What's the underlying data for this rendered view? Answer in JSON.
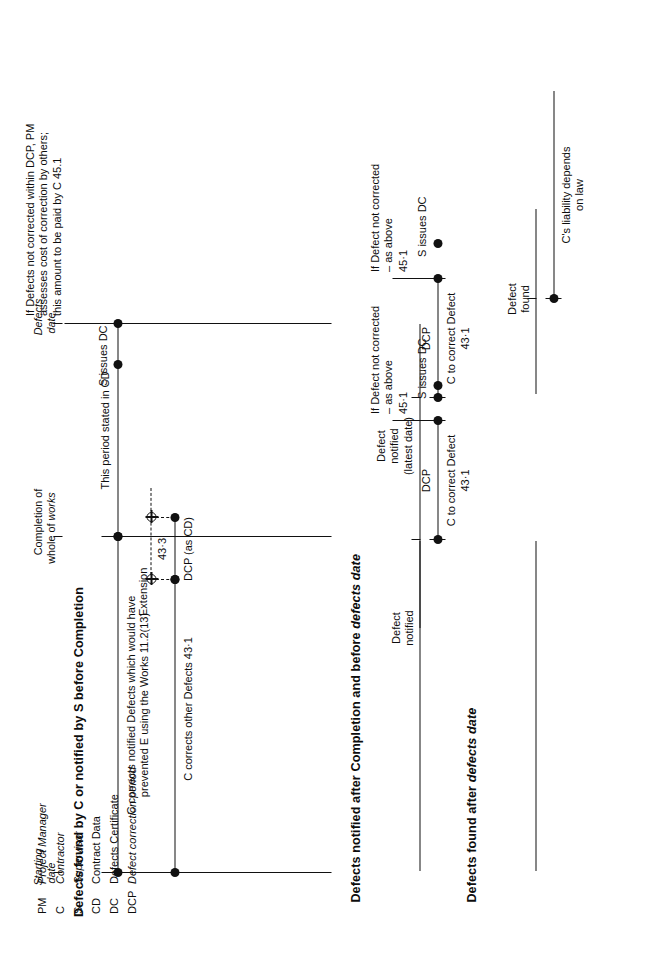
{
  "diagram": {
    "legend": {
      "rows": [
        {
          "key": "PM",
          "label": "Project Manager",
          "italic": true
        },
        {
          "key": "C",
          "label": "Contractor",
          "italic": true
        },
        {
          "key": "S",
          "label": "Supervisor",
          "italic": true
        },
        {
          "key": "CD",
          "label": "Contract Data",
          "italic": false
        },
        {
          "key": "DC",
          "label": "Defects Certificate",
          "italic": false
        },
        {
          "key": "DCP",
          "label": "Defect correction period",
          "italic": true
        }
      ]
    },
    "axis_captions": {
      "starting_date": "Starting\ndate",
      "completion": "Completion of\nwhole of works",
      "defects_date": "Defects\ndate"
    },
    "panels": [
      {
        "id": "panel-1",
        "title": "Defects found by C or notified by S before Completion",
        "labels": {
          "corrects_notified": "C corrects notified Defects which would have\nprevented E using the Works 11.2(13)",
          "corrects_other": "C corrects other Defects 43·1",
          "this_period": "This period stated in CD",
          "dcp_as_cd": "DCP (as CD)",
          "extension": "Extension",
          "extension_clause": "43·3",
          "s_issues_dc": "S issues DC",
          "pm_assesses": "If Defects not corrected within DCP, PM\nassesses cost of correction by others;\nthis amount to be paid by C 45.1"
        }
      },
      {
        "id": "panel-2",
        "title": "Defects notified after Completion and before defects date",
        "title_italic_tail": "defects date",
        "groups": [
          {
            "id": "group-early",
            "defect_notified": "Defect\nnotified",
            "dcp": "DCP",
            "c_to_correct": "C to correct Defect",
            "c_to_correct_clause": "43·1",
            "s_issues_dc": "S issues DC",
            "if_not_corrected": "If Defect not corrected\n– as above",
            "if_not_corrected_clause": "45·1"
          },
          {
            "id": "group-latest",
            "defect_notified": "Defect\nnotified\n(latest date)",
            "dcp": "DCP",
            "c_to_correct": "C to correct Defect",
            "c_to_correct_clause": "43·1",
            "s_issues_dc": "S issues DC",
            "if_not_corrected": "If Defect not corrected\n– as above",
            "if_not_corrected_clause": "45·1"
          }
        ]
      },
      {
        "id": "panel-3",
        "title": "Defects found after defects date",
        "title_italic_tail": "defects date",
        "labels": {
          "defect_found": "Defect\nfound",
          "liability": "C's liability depends\non law"
        }
      }
    ],
    "colors": {
      "ink": "#111111",
      "paper": "#ffffff"
    }
  }
}
